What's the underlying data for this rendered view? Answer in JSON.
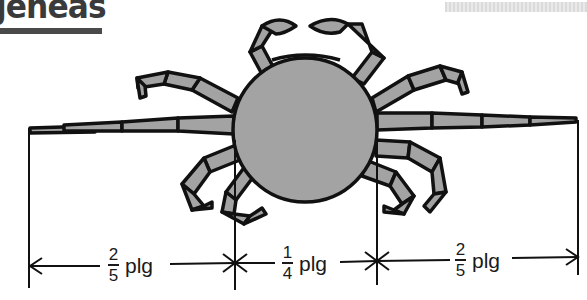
{
  "header": {
    "title_fragment": "jeneas"
  },
  "diagram": {
    "unit": "plg",
    "colors": {
      "ink": "#111111",
      "body_fill": "#a3a3a3",
      "heading": "#3a3a3a"
    },
    "measurements": [
      {
        "id": "left-leg",
        "numerator": "2",
        "denominator": "5",
        "unit": "plg"
      },
      {
        "id": "body",
        "numerator": "1",
        "denominator": "4",
        "unit": "plg"
      },
      {
        "id": "right-leg",
        "numerator": "2",
        "denominator": "5",
        "unit": "plg"
      }
    ]
  }
}
